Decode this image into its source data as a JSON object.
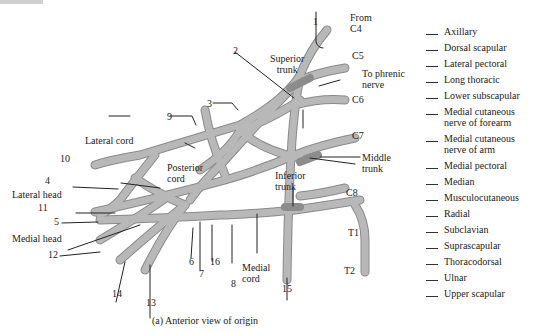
{
  "figure": {
    "caption": "(a) Anterior view of origin",
    "colors": {
      "nerve_fill": "#b3b3b3",
      "nerve_stroke": "#8a8a8a",
      "trunk_shade": "#8c8c8c",
      "leader_line": "#222222",
      "background": "#ffffff"
    }
  },
  "structure_labels": {
    "from_c4": "From\nC4",
    "c5": "C5",
    "c6": "C6",
    "c7": "C7",
    "c8": "C8",
    "t1": "T1",
    "t2": "T2",
    "superior_trunk": "Superior\ntrunk",
    "to_phrenic": "To phrenic\nnerve",
    "middle_trunk": "Middle\ntrunk",
    "inferior_trunk": "Inferior\ntrunk",
    "lateral_cord": "Lateral cord",
    "posterior_cord": "Posterior\ncord",
    "medial_cord": "Medial\ncord",
    "lateral_head": "Lateral head",
    "medial_head": "Medial head"
  },
  "numbers": [
    "1",
    "2",
    "3",
    "4",
    "5",
    "6",
    "7",
    "8",
    "9",
    "10",
    "11",
    "12",
    "13",
    "14",
    "15",
    "16"
  ],
  "legend": {
    "items": [
      "Axillary",
      "Dorsal scapular",
      "Lateral pectoral",
      "Long thoracic",
      "Lower subscapular",
      "Medial cutaneous\nnerve of forearm",
      "Medial cutaneous\nnerve of arm",
      "Medial pectoral",
      "Median",
      "Musculocutaneous",
      "Radial",
      "Subclavian",
      "Suprascapular",
      "Thoracodorsal",
      "Ulnar",
      "Upper scapular"
    ]
  }
}
